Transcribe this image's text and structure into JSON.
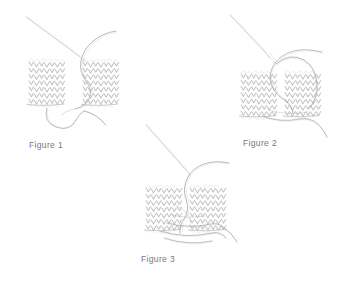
{
  "document": {
    "type": "knitting-technique-illustration",
    "background_color": "#ffffff",
    "ink_color": "#9a9ca1",
    "caption_color": "#77787b",
    "width": 343,
    "height": 288
  },
  "figures": [
    {
      "id": "figure-1",
      "caption": "Figure 1",
      "caption_x": 29,
      "caption_y": 140,
      "elements": {
        "needle": "straight-knitting-needle",
        "yarn": "working-yarn-strand",
        "fabric_left": "knit-stitch-block-left",
        "fabric_right": "knit-stitch-block-right",
        "loop": "yarn-loop-below-edge"
      }
    },
    {
      "id": "figure-2",
      "caption": "Figure 2",
      "caption_x": 243,
      "caption_y": 138,
      "elements": {
        "needle": "straight-knitting-needle",
        "yarn": "working-yarn-strand",
        "fabric_left": "knit-stitch-block-left",
        "fabric_right": "knit-stitch-block-right",
        "loop": "yarn-arc-over-fabric"
      }
    },
    {
      "id": "figure-3",
      "caption": "Figure 3",
      "caption_x": 141,
      "caption_y": 254,
      "elements": {
        "needle": "straight-knitting-needle",
        "yarn": "working-yarn-strand",
        "fabric_left": "knit-stitch-block-left",
        "fabric_right": "knit-stitch-block-right",
        "loop": "yarn-wraps-at-fabric-base"
      }
    }
  ]
}
